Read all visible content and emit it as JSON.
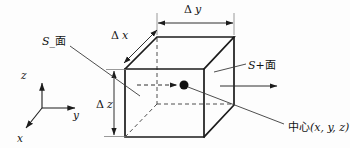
{
  "diagram": {
    "dims": {
      "dy": {
        "symbol": "Δ",
        "var": "y"
      },
      "dx": {
        "symbol": "Δ",
        "var": "x"
      },
      "dz": {
        "symbol": "Δ",
        "var": "z"
      }
    },
    "faces": {
      "minus": {
        "symbol": "S",
        "suffix": "_面"
      },
      "plus": {
        "symbol": "S",
        "suffix": "+面"
      }
    },
    "center": {
      "prefix": "中心",
      "coords": "(x, y, z)"
    },
    "axes": {
      "x": "x",
      "y": "y",
      "z": "z"
    },
    "colors": {
      "edge": "#1c1c1c",
      "annotation": "#2e2e2e",
      "hidden_edge": "#4f4f4f",
      "background": "#fdfdfd"
    }
  }
}
